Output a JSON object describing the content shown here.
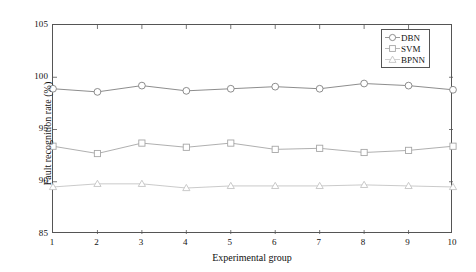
{
  "chart_data": {
    "type": "line",
    "title": "",
    "xlabel": "Experimental group",
    "ylabel": "Fault recognition rate (%)",
    "x": [
      1,
      2,
      3,
      4,
      5,
      6,
      7,
      8,
      9,
      10
    ],
    "xlim": [
      1,
      10
    ],
    "ylim": [
      85,
      105
    ],
    "xticks": [
      "1",
      "2",
      "3",
      "4",
      "5",
      "6",
      "7",
      "8",
      "9",
      "10"
    ],
    "yticks": [
      "85",
      "90",
      "95",
      "100",
      "105"
    ],
    "grid": false,
    "legend_position": "top-right",
    "series": [
      {
        "name": "DBN",
        "marker": "circle",
        "color": "#808080",
        "values": [
          98.9,
          98.6,
          99.2,
          98.7,
          98.9,
          99.1,
          98.9,
          99.4,
          99.2,
          98.8
        ]
      },
      {
        "name": "SVM",
        "marker": "square",
        "color": "#a6a6a6",
        "values": [
          93.4,
          92.7,
          93.7,
          93.3,
          93.7,
          93.1,
          93.2,
          92.8,
          93.0,
          93.4
        ]
      },
      {
        "name": "BPNN",
        "marker": "triangle",
        "color": "#c4c4c4",
        "values": [
          89.5,
          89.8,
          89.8,
          89.4,
          89.6,
          89.6,
          89.6,
          89.7,
          89.6,
          89.5
        ]
      }
    ]
  },
  "legend": {
    "items": [
      {
        "label": "DBN"
      },
      {
        "label": "SVM"
      },
      {
        "label": "BPNN"
      }
    ]
  },
  "axes": {
    "x_title": "Experimental group",
    "y_title": "Fault recognition rate (%)"
  }
}
